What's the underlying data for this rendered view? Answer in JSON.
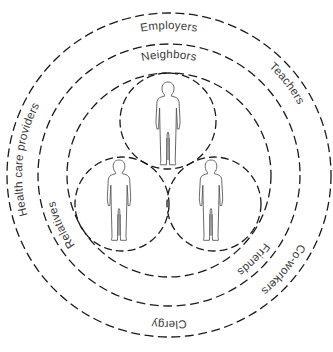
{
  "diagram": {
    "title": "",
    "rings": [
      {
        "id": "outer",
        "labels": [
          "Employers",
          "Teachers",
          "Co-workers",
          "Clergy",
          "Health care providers"
        ]
      },
      {
        "id": "middle",
        "labels": [
          "Neighbors",
          "Friends",
          "Relatives"
        ]
      }
    ],
    "labels": {
      "employers": "Employers",
      "neighbors": "Neighbors",
      "teachers": "Teachers",
      "health_care_providers": "Health care providers",
      "relatives": "Relatives",
      "friends": "Friends",
      "coworkers": "Co-workers",
      "clergy": "Clergy"
    },
    "people": [
      {
        "id": "top",
        "icon": "person-icon"
      },
      {
        "id": "bottom-left",
        "icon": "person-icon"
      },
      {
        "id": "bottom-right",
        "icon": "person-icon"
      }
    ],
    "colors": {
      "line": "#1a1a1a",
      "text": "#3a3a3a",
      "figure": "#555555",
      "background": "#ffffff"
    }
  }
}
